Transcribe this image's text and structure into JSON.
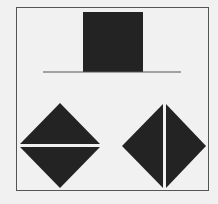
{
  "figure": {
    "colors": {
      "background": "#f1f1f1",
      "shape_fill": "#232323",
      "frame_stroke": "#555555",
      "line_stroke": "#555555",
      "split_gap": "#e8e8e8"
    },
    "shapes": [
      {
        "id": "square",
        "type": "square",
        "x": 83,
        "y": 12,
        "size": 60
      },
      {
        "id": "baseline",
        "type": "line",
        "x1": 43,
        "y1": 72,
        "x2": 181,
        "y2": 72
      },
      {
        "id": "diamond-left",
        "type": "diamond",
        "cx": 60,
        "cy": 145,
        "rx": 40,
        "ry": 42,
        "split": "horizontal"
      },
      {
        "id": "diamond-right",
        "type": "diamond",
        "cx": 164,
        "cy": 146,
        "rx": 42,
        "ry": 42,
        "split": "vertical"
      }
    ]
  }
}
